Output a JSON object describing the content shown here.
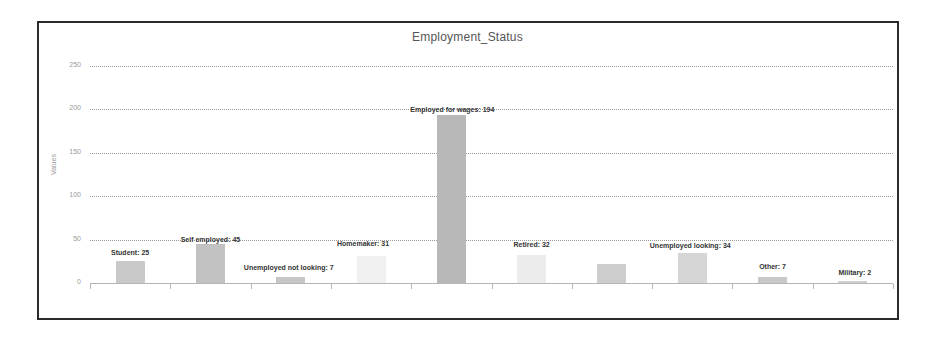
{
  "chart_data": {
    "type": "bar",
    "title": "Employment_Status",
    "xlabel": "",
    "ylabel": "Values",
    "ylim": [
      0,
      250
    ],
    "yticks": [
      0,
      50,
      100,
      150,
      200,
      250
    ],
    "grid": true,
    "legend": null,
    "categories": [
      "Student",
      "Self employed",
      "Unemployed not looking",
      "Homemaker",
      "Employed for wages",
      "Retired",
      "",
      "Unemployed looking",
      "Other",
      "Military"
    ],
    "values": [
      25,
      45,
      7,
      31,
      194,
      32,
      22,
      34,
      7,
      2
    ],
    "data_labels": [
      "Student: 25",
      "Self employed: 45",
      "Unemployed not looking: 7",
      "Homemaker: 31",
      "Employed for wages: 194",
      "Retired: 32",
      "",
      "Unemployed looking: 34",
      "Other: 7",
      "Military: 2"
    ],
    "bar_colors": [
      "#c9c9c9",
      "#c2c2c2",
      "#c6c6c6",
      "#f0f0f0",
      "#b8b8b8",
      "#ececec",
      "#cdcdcd",
      "#d6d6d6",
      "#c8c8c8",
      "#d0d0d0"
    ]
  }
}
